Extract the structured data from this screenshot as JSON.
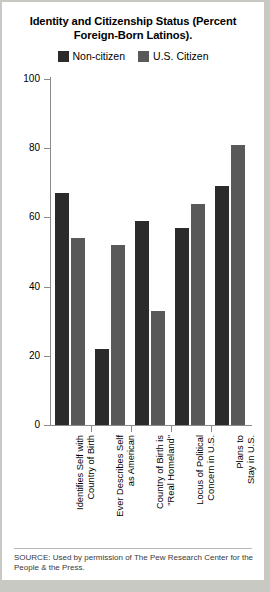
{
  "chart_data": {
    "type": "bar",
    "title": "Identity and Citizenship Status (Percent Foreign-Born Latinos).",
    "xlabel": "",
    "ylabel": "",
    "ylim": [
      0,
      100
    ],
    "yticks": [
      0,
      20,
      40,
      60,
      80,
      100
    ],
    "grid": false,
    "legend_position": "top-center",
    "categories": [
      "Identifies Self with\nCountry of Birth",
      "Ever Describes Self\nas American",
      "Country of Birth is\n\"Real Homeland\"",
      "Locus of Political\nConcern in U.S.",
      "Plans to\nStay in U.S."
    ],
    "series": [
      {
        "name": "Non-citizen",
        "color": "#2b2b2b",
        "values": [
          67,
          22,
          59,
          57,
          69
        ]
      },
      {
        "name": "U.S. Citizen",
        "color": "#595959",
        "values": [
          54,
          52,
          33,
          64,
          81
        ]
      }
    ],
    "source": "SOURCE: Used by permission of The Pew Research Center for the People & the Press."
  },
  "colors": {
    "page_background": "#c9c9c4",
    "card_background": "#ffffff",
    "axis": "#8a8a8a",
    "text": "#000000",
    "source_text": "#3a3a3a"
  }
}
